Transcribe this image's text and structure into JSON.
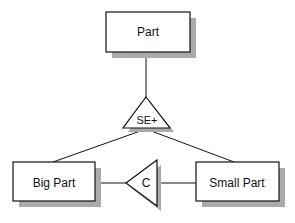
{
  "diagram": {
    "entities": [
      {
        "id": "part",
        "label": "Part"
      },
      {
        "id": "big_part",
        "label": "Big Part"
      },
      {
        "id": "small_part",
        "label": "Small Part"
      }
    ],
    "connectors": [
      {
        "id": "specialization",
        "label": "SE+"
      },
      {
        "id": "constraint",
        "label": "C"
      }
    ],
    "colors": {
      "stroke": "#111111",
      "fill": "#ffffff",
      "shadow": "#aaaaaa"
    }
  }
}
